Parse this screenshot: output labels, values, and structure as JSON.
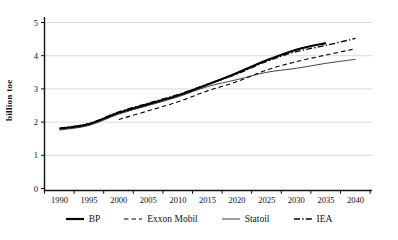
{
  "chart_data": {
    "type": "line",
    "title": "",
    "xlabel": "",
    "ylabel": "billion toe",
    "ylim": [
      0,
      5
    ],
    "y_ticks": [
      0,
      1,
      2,
      3,
      4,
      5
    ],
    "x_ticks": [
      "1990",
      "1995",
      "2000",
      "2005",
      "2010",
      "2015",
      "2020",
      "2025",
      "2030",
      "2035",
      "2040"
    ],
    "grid": "horizontal-light",
    "legend_position": "bottom",
    "axis_color": "#111111",
    "grid_color": "#c9c9c9",
    "series": [
      {
        "name": "BP",
        "color": "#000000",
        "line_style": "solid-thick",
        "x": [
          1990,
          1995,
          2000,
          2005,
          2010,
          2015,
          2020,
          2025,
          2030,
          2035
        ],
        "values": [
          1.8,
          1.94,
          2.28,
          2.54,
          2.8,
          3.13,
          3.48,
          3.86,
          4.18,
          4.38
        ]
      },
      {
        "name": "Exxon Mobil",
        "color": "#000000",
        "line_style": "dashed",
        "x": [
          2000,
          2005,
          2010,
          2015,
          2020,
          2025,
          2030,
          2035,
          2040
        ],
        "values": [
          2.08,
          2.34,
          2.61,
          2.94,
          3.22,
          3.57,
          3.82,
          4.02,
          4.21
        ]
      },
      {
        "name": "Statoil",
        "color": "#222222",
        "line_style": "solid-thin",
        "x": [
          1990,
          1995,
          2000,
          2005,
          2010,
          2015,
          2020,
          2025,
          2030,
          2035,
          2040
        ],
        "values": [
          1.76,
          1.9,
          2.24,
          2.5,
          2.76,
          3.07,
          3.28,
          3.5,
          3.62,
          3.77,
          3.89
        ]
      },
      {
        "name": "IEA",
        "color": "#000000",
        "line_style": "dash-dot",
        "x": [
          1990,
          1995,
          2000,
          2005,
          2010,
          2015,
          2020,
          2025,
          2030,
          2035,
          2040
        ],
        "values": [
          1.82,
          1.96,
          2.31,
          2.57,
          2.83,
          3.14,
          3.45,
          3.83,
          4.12,
          4.31,
          4.52
        ]
      }
    ]
  }
}
